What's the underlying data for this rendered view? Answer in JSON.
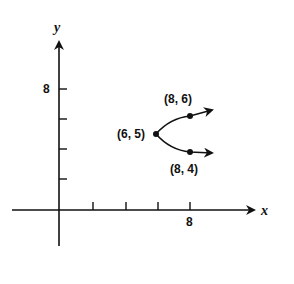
{
  "diagram": {
    "axes": {
      "x_label": "x",
      "y_label": "y",
      "x_tick_label": "8",
      "y_tick_label": "8",
      "x_ticks": [
        2,
        4,
        6,
        8
      ],
      "y_ticks": [
        2,
        4,
        6,
        8
      ]
    },
    "points": {
      "vertex": "(6, 5)",
      "upper": "(8, 6)",
      "lower": "(8, 4)"
    },
    "colors": {
      "ink": "#111111",
      "background": "#ffffff"
    }
  }
}
